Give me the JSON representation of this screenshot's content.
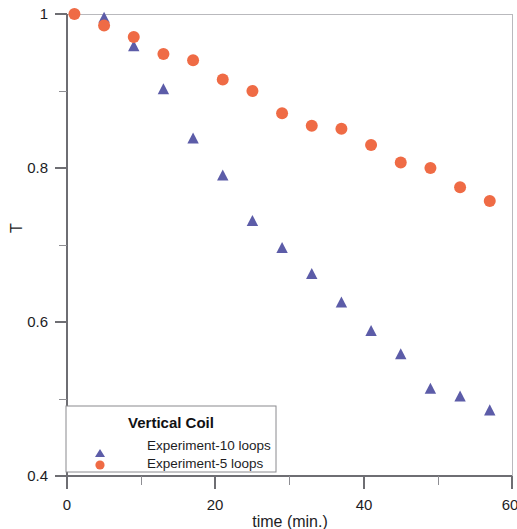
{
  "chart_data": {
    "type": "scatter",
    "title": "",
    "xlabel": "time (min.)",
    "ylabel": "T",
    "xlim": [
      0,
      60
    ],
    "ylim": [
      0.4,
      1.0
    ],
    "xticks": [
      0,
      20,
      40,
      60
    ],
    "xtick_labels": [
      "0",
      "20",
      "40",
      "60"
    ],
    "xminor_ticks": [
      10,
      30,
      50
    ],
    "yticks": [
      0.4,
      0.6,
      0.8,
      1.0
    ],
    "ytick_labels": [
      "0.4",
      "0.6",
      "0.8",
      "1"
    ],
    "yminor_ticks": [
      0.5,
      0.7,
      0.9
    ],
    "grid": false,
    "legend_position": "bottom-left",
    "legend_title": "Vertical Coil",
    "series": [
      {
        "name": "Experiment-10 loops",
        "marker": "triangle",
        "color": "#5c5ca8",
        "points": [
          [
            5,
            0.995
          ],
          [
            9,
            0.958
          ],
          [
            13,
            0.902
          ],
          [
            17,
            0.838
          ],
          [
            21,
            0.79
          ],
          [
            25,
            0.731
          ],
          [
            29,
            0.696
          ],
          [
            33,
            0.662
          ],
          [
            37,
            0.625
          ],
          [
            41,
            0.588
          ],
          [
            45,
            0.558
          ],
          [
            49,
            0.513
          ],
          [
            53,
            0.503
          ],
          [
            57,
            0.485
          ]
        ]
      },
      {
        "name": "Experiment-5 loops",
        "marker": "circle",
        "color": "#ef6b45",
        "points": [
          [
            1,
            1.0
          ],
          [
            5,
            0.985
          ],
          [
            9,
            0.97
          ],
          [
            13,
            0.948
          ],
          [
            17,
            0.94
          ],
          [
            21,
            0.915
          ],
          [
            25,
            0.9
          ],
          [
            29,
            0.871
          ],
          [
            33,
            0.855
          ],
          [
            37,
            0.851
          ],
          [
            41,
            0.83
          ],
          [
            45,
            0.807
          ],
          [
            49,
            0.8
          ],
          [
            53,
            0.775
          ],
          [
            57,
            0.757
          ]
        ]
      }
    ]
  },
  "legend": {
    "title": "Vertical Coil",
    "entries": [
      {
        "label": "Experiment-10 loops",
        "marker": "triangle-icon",
        "color": "#5c5ca8"
      },
      {
        "label": "Experiment-5 loops",
        "marker": "circle-icon",
        "color": "#ef6b45"
      }
    ]
  },
  "axes": {
    "x_title": "time (min.)",
    "y_title": "T"
  }
}
